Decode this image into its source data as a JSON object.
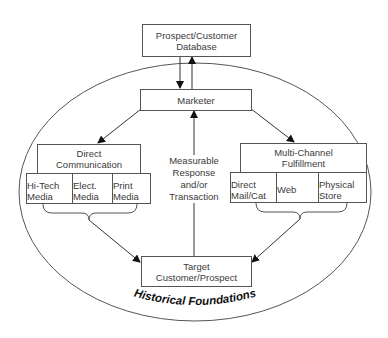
{
  "diagram": {
    "database": {
      "label_line1": "Prospect/Customer",
      "label_line2": "Database"
    },
    "marketer": {
      "label": "Marketer"
    },
    "direct_communication": {
      "label_line1": "Direct",
      "label_line2": "Communication",
      "channels": [
        {
          "line1": "Hi-Tech",
          "line2": "Media"
        },
        {
          "line1": "Elect.",
          "line2": "Media"
        },
        {
          "line1": "Print",
          "line2": "Media"
        }
      ]
    },
    "fulfillment": {
      "label_line1": "Multi-Channel",
      "label_line2": "Fulfillment",
      "channels": [
        {
          "line1": "Direct",
          "line2": "Mail/Cat"
        },
        {
          "line1": "Web",
          "line2": ""
        },
        {
          "line1": "Physical",
          "line2": "Store"
        }
      ]
    },
    "response": {
      "line1": "Measurable",
      "line2": "Response",
      "line3": "and/or",
      "line4": "Transaction"
    },
    "target": {
      "label_line1": "Target",
      "label_line2": "Customer/Prospect"
    },
    "foundation_label": "Historical Foundations",
    "colors": {
      "line": "#555555",
      "text": "#3a3a3a",
      "background": "#ffffff"
    }
  }
}
